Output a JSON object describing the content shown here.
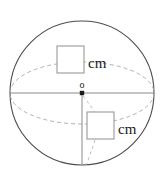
{
  "figure": {
    "shape": "circle",
    "colors": {
      "outline": "#4d4d4d",
      "dashed": "#9a9a9a",
      "diameter_line": "#8a8a8a",
      "box_border": "#9a9a9a",
      "text": "#1a1a1a",
      "background": "#ffffff"
    },
    "circle": {
      "center_x": 82,
      "center_y": 93,
      "radius": 72
    },
    "equator_ellipse": {
      "rx": 72,
      "ry": 31,
      "style": "dashed"
    },
    "center_point": {
      "label": "o",
      "x": 82,
      "y": 93
    },
    "lines": {
      "horizontal_diameter": "solid",
      "vertical_radius": "solid",
      "radius_leader_top": "dashed",
      "radius_leader_bottom": "dashed"
    },
    "answer_boxes": [
      {
        "name": "upper-answer-box",
        "value": "",
        "placeholder": "",
        "unit": "cm",
        "x": 57,
        "y": 46,
        "width": 27,
        "height": 27
      },
      {
        "name": "lower-answer-box",
        "value": "",
        "placeholder": "",
        "unit": "cm",
        "x": 87,
        "y": 112,
        "width": 27,
        "height": 27
      }
    ],
    "units": {
      "upper": "cm",
      "lower": "cm"
    }
  }
}
